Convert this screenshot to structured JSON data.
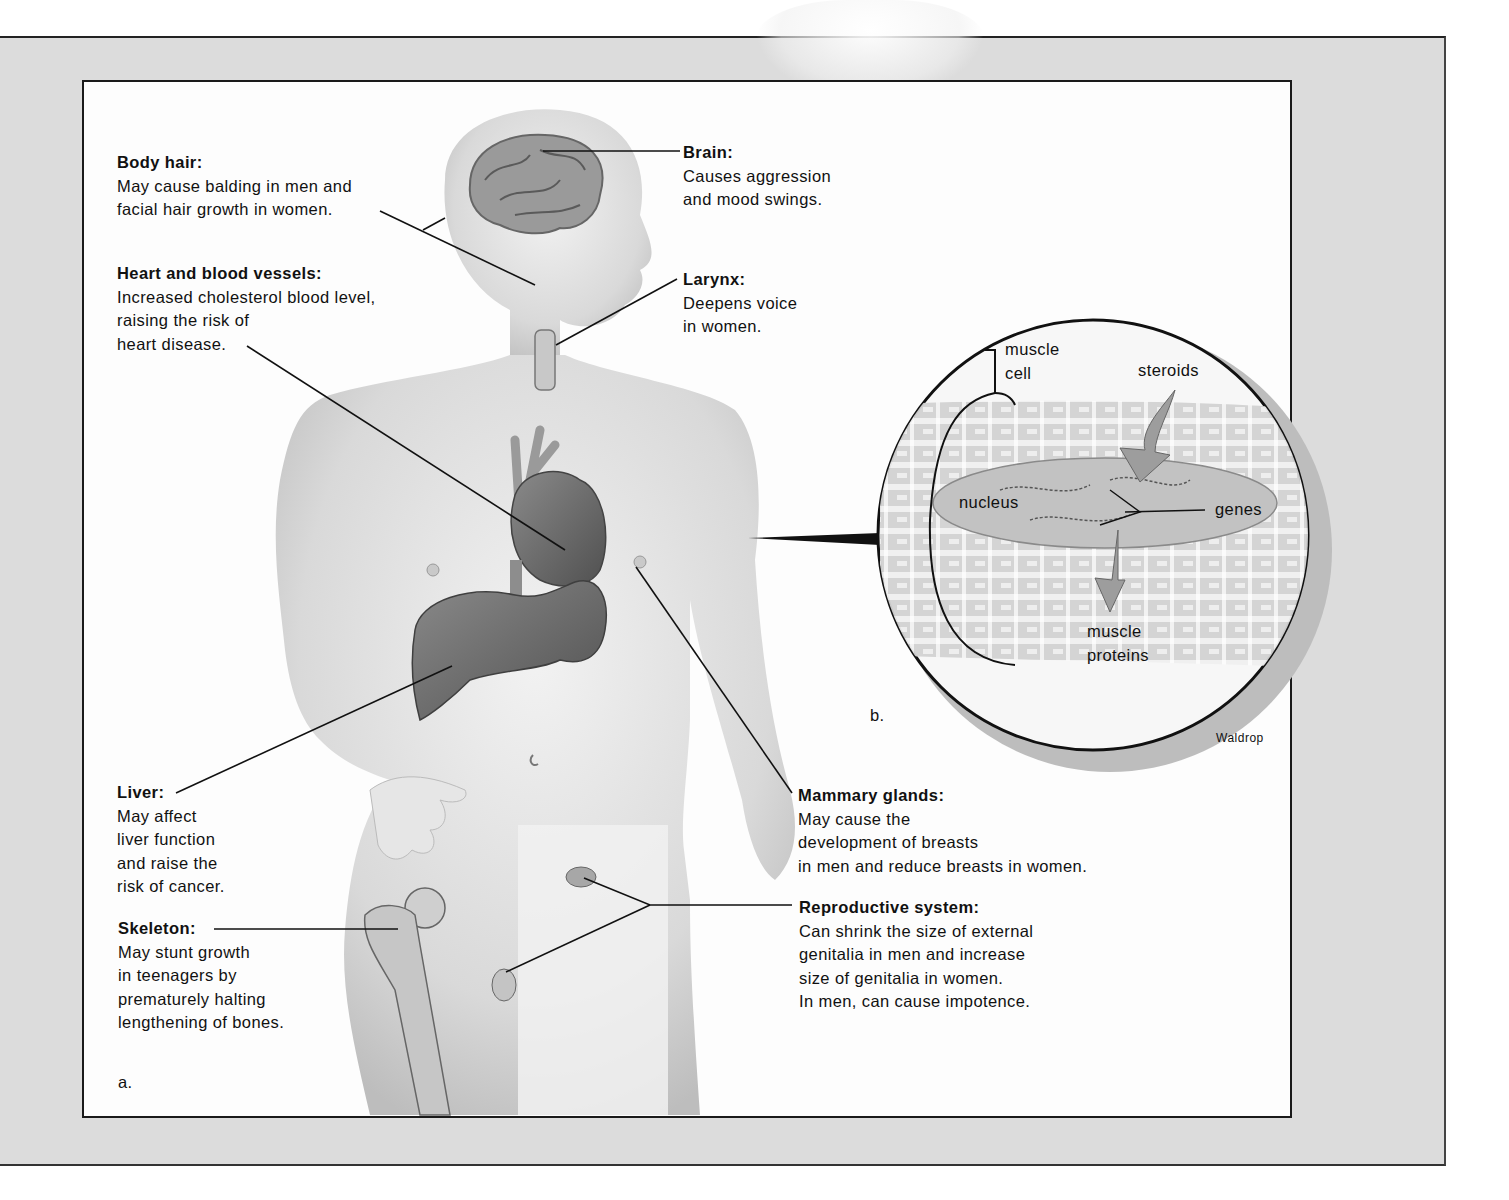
{
  "figure": {
    "panel_a_label": "a.",
    "panel_b_label": "b.",
    "credit": "Waldrop",
    "colors": {
      "background": "#ffffff",
      "page_gray": "#dcdcdc",
      "panel": "#fdfdfd",
      "skin": "#d4d4d4",
      "organ": "#6a6a6a",
      "line": "#111111"
    }
  },
  "callouts": {
    "body_hair": {
      "title": "Body hair:",
      "lines": [
        "May cause balding in men and",
        "facial hair growth in women."
      ]
    },
    "heart": {
      "title": "Heart and blood vessels:",
      "lines": [
        "Increased cholesterol blood level,",
        "raising the risk of",
        "heart disease."
      ]
    },
    "brain": {
      "title": "Brain:",
      "lines": [
        "Causes aggression",
        "and mood swings."
      ]
    },
    "larynx": {
      "title": "Larynx:",
      "lines": [
        "Deepens voice",
        "in women."
      ]
    },
    "liver": {
      "title": "Liver:",
      "lines": [
        "May affect",
        "liver function",
        "and raise the",
        "risk of cancer."
      ]
    },
    "skeleton": {
      "title": "Skeleton:",
      "lines": [
        "May stunt growth",
        "in teenagers by",
        "prematurely halting",
        "lengthening of bones."
      ]
    },
    "mammary": {
      "title": "Mammary glands:",
      "lines": [
        "May cause the",
        "development of breasts",
        "in men and reduce breasts in women."
      ]
    },
    "reproductive": {
      "title": "Reproductive system:",
      "lines": [
        "Can shrink the size of external",
        "genitalia in men and increase",
        "size of genitalia in women.",
        "In men, can cause impotence."
      ]
    }
  },
  "inset": {
    "muscle_cell": [
      "muscle",
      "cell"
    ],
    "steroids": "steroids",
    "nucleus": "nucleus",
    "genes": "genes",
    "muscle_proteins": [
      "muscle",
      "proteins"
    ]
  }
}
